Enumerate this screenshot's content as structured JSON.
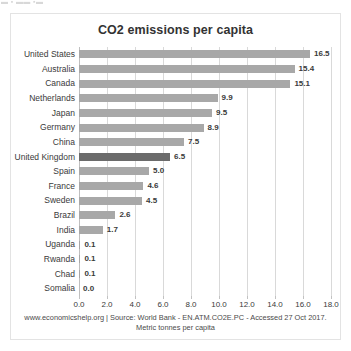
{
  "scan_artifact": "▬ ▪ ▬▬ ▪▬",
  "chart_data": {
    "type": "bar",
    "orientation": "horizontal",
    "title": "CO2 emissions per capita",
    "xlabel": "",
    "ylabel": "",
    "xlim": [
      0.0,
      18.0
    ],
    "xticks": [
      "0.0",
      "2.0",
      "4.0",
      "6.0",
      "8.0",
      "10.0",
      "12.0",
      "14.0",
      "16.0",
      "18.0"
    ],
    "grid": true,
    "legend": false,
    "categories": [
      "United States",
      "Australia",
      "Canada",
      "Netherlands",
      "Japan",
      "Germany",
      "China",
      "United Kingdom",
      "Spain",
      "France",
      "Sweden",
      "Brazil",
      "India",
      "Uganda",
      "Rwanda",
      "Chad",
      "Somalia"
    ],
    "values": [
      16.5,
      15.4,
      15.1,
      9.9,
      9.5,
      8.9,
      7.5,
      6.5,
      5.0,
      4.6,
      4.5,
      2.6,
      1.7,
      0.1,
      0.1,
      0.1,
      0.0
    ],
    "value_labels": [
      "16.5",
      "15.4",
      "15.1",
      "9.9",
      "9.5",
      "8.9",
      "7.5",
      "6.5",
      "5.0",
      "4.6",
      "4.5",
      "2.6",
      "1.7",
      "0.1",
      "0.1",
      "0.1",
      "0.0"
    ],
    "highlighted_category": "United Kingdom",
    "colors": {
      "bar": "#a8a8a8",
      "bar_highlight": "#6b6b6b",
      "gridline": "#d9d9d9",
      "text": "#3a3a3a"
    }
  },
  "footer": {
    "line1": "www.economicshelp.org | Source: World Bank - EN.ATM.CO2E.PC - Accessed 27 Oct 2017.",
    "line2": "Metric tonnes per capita"
  }
}
